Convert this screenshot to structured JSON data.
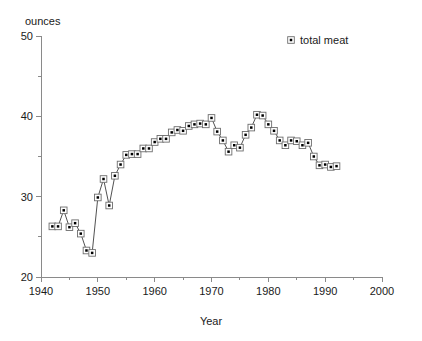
{
  "chart_data": {
    "type": "line",
    "title": "",
    "xlabel": "Year",
    "ylabel": "ounces",
    "xlim": [
      1940,
      2000
    ],
    "ylim": [
      20,
      50
    ],
    "grid": false,
    "legend_position": "top-right",
    "x_major_ticks": [
      1940,
      1950,
      1960,
      1970,
      1980,
      1990,
      2000
    ],
    "x_major_tick_labels": [
      "1940",
      "1950",
      "1960",
      "1970",
      "1980",
      "1990",
      "2000"
    ],
    "x_minor_ticks": [
      1945,
      1955,
      1965,
      1975,
      1985,
      1995
    ],
    "y_major_ticks": [
      20,
      30,
      40,
      50
    ],
    "y_major_tick_labels": [
      "20",
      "30",
      "40",
      "50"
    ],
    "y_minor_ticks": [
      25,
      35,
      45
    ],
    "marker_style": "open-square-with-dot",
    "series": [
      {
        "name": "total meat",
        "color": "#000000",
        "x": [
          1942,
          1943,
          1944,
          1945,
          1946,
          1947,
          1948,
          1949,
          1950,
          1951,
          1952,
          1953,
          1954,
          1955,
          1956,
          1957,
          1958,
          1959,
          1960,
          1961,
          1962,
          1963,
          1964,
          1965,
          1966,
          1967,
          1968,
          1969,
          1970,
          1971,
          1972,
          1973,
          1974,
          1975,
          1976,
          1977,
          1978,
          1979,
          1980,
          1981,
          1982,
          1983,
          1984,
          1985,
          1986,
          1987,
          1988,
          1989,
          1990,
          1991,
          1992
        ],
        "values": [
          26.3,
          26.3,
          28.3,
          26.2,
          26.7,
          25.4,
          23.3,
          23.0,
          29.9,
          32.2,
          28.9,
          32.6,
          34.0,
          35.2,
          35.3,
          35.3,
          36.0,
          36.0,
          36.8,
          37.2,
          37.2,
          38.0,
          38.3,
          38.2,
          38.8,
          39.0,
          39.1,
          39.0,
          39.8,
          38.1,
          37.0,
          35.6,
          36.4,
          36.1,
          37.7,
          38.6,
          40.2,
          40.1,
          39.0,
          38.2,
          37.0,
          36.4,
          37.0,
          36.9,
          36.4,
          36.7,
          35.0,
          33.9,
          34.0,
          33.7,
          33.8
        ]
      }
    ]
  },
  "legend": {
    "entries": [
      {
        "label": "total meat",
        "marker": "square-dot-marker"
      }
    ]
  },
  "labels": {
    "y_axis_caption": "ounces",
    "x_axis_caption": "Year"
  }
}
